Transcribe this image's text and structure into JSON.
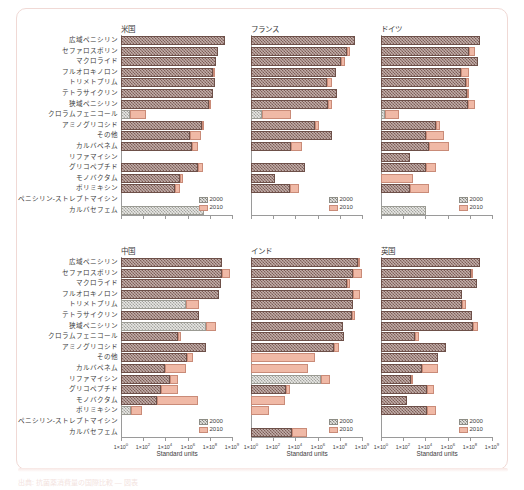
{
  "figure": {
    "xaxis_title": "Standard units",
    "legend": [
      {
        "key": "y2000",
        "label": "2000"
      },
      {
        "key": "y2010",
        "label": "2010"
      }
    ],
    "xtick_labels": [
      "1×10",
      "1×10",
      "1×10",
      "1×10",
      "1×10",
      "1×10"
    ],
    "xtick_exponents": [
      "0",
      "2",
      "4",
      "6",
      "8",
      "9"
    ],
    "categories": [
      "広域ペニシリン",
      "セファロスポリン",
      "マクロライド",
      "フルオロキノロン",
      "トリメトプリム",
      "テトラサイクリン",
      "狭域ペニシリン",
      "クロラムフェニコール",
      "アミノグリコシド",
      "その他",
      "カルバペネム",
      "リファマイシン",
      "グリコペプチド",
      "モノバクタム",
      "ポリミキシン",
      "ペニシリン-ストレプトマイシン",
      "カルバセフェム"
    ],
    "footnote": "出典: 抗菌薬消費量の国際比較 — 図表"
  },
  "chart_data": {
    "type": "bar",
    "orientation": "horizontal",
    "title": "",
    "xlabel": "Standard units",
    "ylabel": "",
    "xscale": "log",
    "xlim": [
      0,
      100
    ],
    "grid": false,
    "legend_position": "bottom-right",
    "categories": [
      "広域ペニシリン",
      "セファロスポリン",
      "マクロライド",
      "フルオロキノロン",
      "トリメトプリム",
      "テトラサイクリン",
      "狭域ペニシリン",
      "クロラムフェニコール",
      "アミノグリコシド",
      "その他",
      "カルバペネム",
      "リファマイシン",
      "グリコペプチド",
      "モノバクタム",
      "ポリミキシン",
      "ペニシリン-ストレプトマイシン",
      "カルバセフェム"
    ],
    "series": [
      {
        "name": "2000",
        "color": "#9d7d76"
      },
      {
        "name": "2010",
        "color": "#f0b9a6"
      }
    ],
    "panels": [
      {
        "name": "米国",
        "row": 0,
        "col": 0,
        "bars": [
          {
            "v2000": 93.0,
            "v2010": 93.0,
            "light": false
          },
          {
            "v2000": 86.5,
            "v2010": 86.5,
            "light": false
          },
          {
            "v2000": 85.0,
            "v2010": 85.0,
            "light": false
          },
          {
            "v2000": 82.5,
            "v2010": 84.0,
            "light": false
          },
          {
            "v2000": 83.5,
            "v2010": 83.5,
            "light": false
          },
          {
            "v2000": 82.5,
            "v2010": 82.5,
            "light": false
          },
          {
            "v2000": 78.5,
            "v2010": 80.5,
            "light": false
          },
          {
            "v2000": 8.0,
            "v2010": 22.5,
            "light": true
          },
          {
            "v2000": 72.0,
            "v2010": 73.5,
            "light": false
          },
          {
            "v2000": 62.0,
            "v2010": 71.0,
            "light": false
          },
          {
            "v2000": 63.0,
            "v2010": 68.5,
            "light": false
          },
          {
            "v2000": 0.0,
            "v2010": 0.0,
            "light": false
          },
          {
            "v2000": 68.5,
            "v2010": 73.5,
            "light": false
          },
          {
            "v2000": 52.5,
            "v2010": 55.0,
            "light": false
          },
          {
            "v2000": 48.0,
            "v2010": 52.5,
            "light": false
          },
          {
            "v2000": 0.0,
            "v2010": 0.0,
            "light": false
          },
          {
            "v2000": 74.0,
            "v2010": 74.0,
            "light": true
          }
        ]
      },
      {
        "name": "フランス",
        "row": 0,
        "col": 1,
        "bars": [
          {
            "v2000": 92.5,
            "v2010": 92.5,
            "light": false
          },
          {
            "v2000": 86.0,
            "v2010": 88.5,
            "light": false
          },
          {
            "v2000": 80.5,
            "v2010": 84.0,
            "light": false
          },
          {
            "v2000": 76.0,
            "v2010": 76.0,
            "light": false
          },
          {
            "v2000": 67.5,
            "v2010": 72.0,
            "light": false
          },
          {
            "v2000": 76.5,
            "v2010": 76.5,
            "light": false
          },
          {
            "v2000": 69.0,
            "v2010": 72.5,
            "light": false
          },
          {
            "v2000": 9.5,
            "v2010": 35.5,
            "light": true
          },
          {
            "v2000": 57.5,
            "v2010": 60.5,
            "light": false
          },
          {
            "v2000": 72.0,
            "v2010": 72.0,
            "light": false
          },
          {
            "v2000": 36.0,
            "v2010": 45.5,
            "light": false
          },
          {
            "v2000": 0.0,
            "v2010": 0.0,
            "light": false
          },
          {
            "v2000": 48.5,
            "v2010": 48.5,
            "light": false
          },
          {
            "v2000": 21.0,
            "v2010": 21.0,
            "light": false
          },
          {
            "v2000": 35.0,
            "v2010": 43.0,
            "light": false
          },
          {
            "v2000": 0.0,
            "v2010": 0.0,
            "light": false
          },
          {
            "v2000": 0.0,
            "v2010": 0.0,
            "light": false
          }
        ]
      },
      {
        "name": "ドイツ",
        "row": 0,
        "col": 2,
        "bars": [
          {
            "v2000": 88.0,
            "v2010": 88.0,
            "light": false
          },
          {
            "v2000": 78.5,
            "v2010": 83.5,
            "light": false
          },
          {
            "v2000": 86.5,
            "v2010": 86.5,
            "light": false
          },
          {
            "v2000": 71.5,
            "v2010": 78.5,
            "light": false
          },
          {
            "v2000": 75.5,
            "v2010": 78.5,
            "light": false
          },
          {
            "v2000": 76.5,
            "v2010": 79.0,
            "light": false
          },
          {
            "v2000": 77.5,
            "v2010": 84.0,
            "light": false
          },
          {
            "v2000": 4.0,
            "v2010": 16.5,
            "light": true
          },
          {
            "v2000": 49.5,
            "v2010": 53.0,
            "light": false
          },
          {
            "v2000": 40.5,
            "v2010": 56.0,
            "light": false
          },
          {
            "v2000": 42.5,
            "v2010": 60.5,
            "light": false
          },
          {
            "v2000": 25.5,
            "v2010": 25.5,
            "light": false
          },
          {
            "v2000": 40.5,
            "v2010": 49.5,
            "light": false
          },
          {
            "v2000": 0.0,
            "v2010": 28.5,
            "light": false
          },
          {
            "v2000": 25.5,
            "v2010": 42.5,
            "light": false
          },
          {
            "v2000": 0.0,
            "v2010": 0.0,
            "light": false
          },
          {
            "v2000": 40.5,
            "v2010": 40.5,
            "light": true
          }
        ]
      },
      {
        "name": "中国",
        "row": 1,
        "col": 0,
        "bars": [
          {
            "v2000": 90.5,
            "v2010": 90.5,
            "light": false
          },
          {
            "v2000": 90.5,
            "v2010": 97.0,
            "light": false
          },
          {
            "v2000": 89.5,
            "v2010": 89.5,
            "light": false
          },
          {
            "v2000": 87.5,
            "v2010": 87.5,
            "light": false
          },
          {
            "v2000": 58.0,
            "v2010": 70.0,
            "light": true
          },
          {
            "v2000": 70.0,
            "v2010": 70.0,
            "light": false
          },
          {
            "v2000": 76.0,
            "v2010": 85.0,
            "light": true
          },
          {
            "v2000": 51.0,
            "v2010": 53.5,
            "light": false
          },
          {
            "v2000": 75.5,
            "v2010": 75.5,
            "light": false
          },
          {
            "v2000": 58.5,
            "v2010": 64.5,
            "light": false
          },
          {
            "v2000": 39.5,
            "v2010": 58.0,
            "light": false
          },
          {
            "v2000": 43.5,
            "v2010": 51.0,
            "light": false
          },
          {
            "v2000": 36.0,
            "v2010": 50.5,
            "light": false
          },
          {
            "v2000": 32.0,
            "v2010": 68.5,
            "light": false
          },
          {
            "v2000": 9.0,
            "v2010": 19.0,
            "light": true
          },
          {
            "v2000": 0.0,
            "v2010": 0.0,
            "light": false
          },
          {
            "v2000": 0.0,
            "v2010": 0.0,
            "light": false
          }
        ]
      },
      {
        "name": "インド",
        "row": 1,
        "col": 1,
        "bars": [
          {
            "v2000": 95.5,
            "v2010": 96.5,
            "light": false
          },
          {
            "v2000": 91.5,
            "v2010": 99.0,
            "light": false
          },
          {
            "v2000": 86.0,
            "v2010": 88.5,
            "light": false
          },
          {
            "v2000": 91.0,
            "v2010": 97.5,
            "light": false
          },
          {
            "v2000": 91.5,
            "v2010": 91.5,
            "light": false
          },
          {
            "v2000": 90.0,
            "v2010": 92.5,
            "light": false
          },
          {
            "v2000": 82.5,
            "v2010": 82.5,
            "light": false
          },
          {
            "v2000": 83.0,
            "v2010": 83.0,
            "light": false
          },
          {
            "v2000": 74.0,
            "v2010": 78.5,
            "light": false
          },
          {
            "v2000": 0.0,
            "v2010": 57.5,
            "light": false
          },
          {
            "v2000": 0.0,
            "v2010": 50.5,
            "light": false
          },
          {
            "v2000": 62.5,
            "v2010": 70.5,
            "light": true
          },
          {
            "v2000": 31.5,
            "v2010": 34.5,
            "light": false
          },
          {
            "v2000": 0.0,
            "v2010": 30.0,
            "light": false
          },
          {
            "v2000": 0.0,
            "v2010": 16.0,
            "light": false
          },
          {
            "v2000": 0.0,
            "v2010": 0.0,
            "light": false
          },
          {
            "v2000": 37.0,
            "v2010": 50.0,
            "light": false
          }
        ]
      },
      {
        "name": "英国",
        "row": 1,
        "col": 2,
        "bars": [
          {
            "v2000": 88.5,
            "v2010": 88.5,
            "light": false
          },
          {
            "v2000": 80.0,
            "v2010": 81.5,
            "light": false
          },
          {
            "v2000": 85.5,
            "v2010": 85.5,
            "light": false
          },
          {
            "v2000": 72.5,
            "v2010": 72.5,
            "light": false
          },
          {
            "v2000": 72.5,
            "v2010": 76.0,
            "light": false
          },
          {
            "v2000": 81.5,
            "v2010": 81.5,
            "light": false
          },
          {
            "v2000": 82.5,
            "v2010": 87.0,
            "light": false
          },
          {
            "v2000": 30.5,
            "v2010": 33.5,
            "light": false
          },
          {
            "v2000": 58.0,
            "v2010": 58.0,
            "light": false
          },
          {
            "v2000": 50.5,
            "v2010": 50.5,
            "light": false
          },
          {
            "v2000": 37.0,
            "v2010": 50.5,
            "light": false
          },
          {
            "v2000": 26.5,
            "v2010": 29.0,
            "light": false
          },
          {
            "v2000": 41.5,
            "v2010": 47.5,
            "light": false
          },
          {
            "v2000": 23.5,
            "v2010": 23.5,
            "light": false
          },
          {
            "v2000": 41.0,
            "v2010": 49.5,
            "light": false
          },
          {
            "v2000": 0.0,
            "v2010": 0.0,
            "light": false
          },
          {
            "v2000": 0.0,
            "v2010": 0.0,
            "light": false
          }
        ]
      }
    ]
  }
}
